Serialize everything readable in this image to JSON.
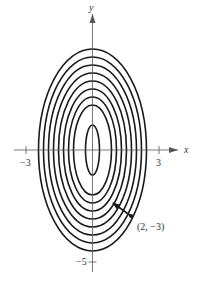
{
  "figure": {
    "type": "level-curves",
    "axes": {
      "x_label": "x",
      "y_label": "y",
      "x_ticks": [
        {
          "value": -3,
          "label": "−3"
        },
        {
          "value": 3,
          "label": "3"
        }
      ],
      "y_ticks": [
        {
          "value": -5,
          "label": "−5"
        }
      ]
    },
    "curve_count": 9,
    "point": {
      "x": 2,
      "y": -3,
      "label": "(2, −3)"
    },
    "colors": {
      "curves": "#1a1a1a",
      "axes": "#555555",
      "background": "#ffffff"
    }
  }
}
